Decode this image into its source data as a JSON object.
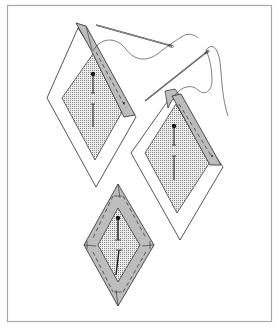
{
  "figure": {
    "frame_color": "#a8a8a8",
    "line_color": "#2a2a2a",
    "fold_fill": "#bdbdbd",
    "paper_fill": "#ffffff",
    "dot_fill": "#e8e8e8",
    "steps": [
      {
        "id": "step-1",
        "description": "Diamond template pinned to fabric; first edge folded over and basted"
      },
      {
        "id": "step-2",
        "description": "Second edge folded at the tip and basted with needle and thread"
      },
      {
        "id": "step-3",
        "description": "All four edges folded and basted around diamond"
      }
    ]
  }
}
